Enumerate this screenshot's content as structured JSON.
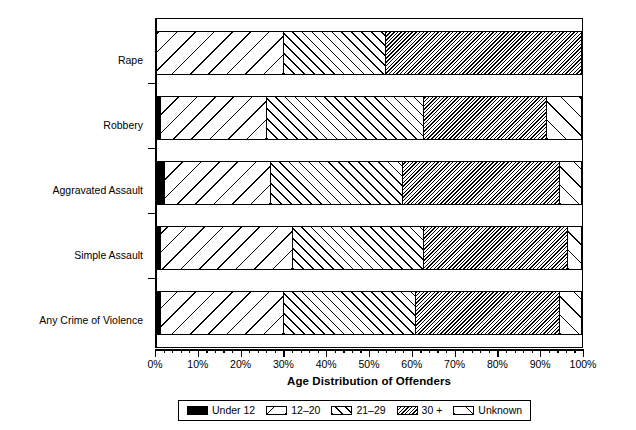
{
  "chart_data": {
    "type": "bar",
    "orientation": "horizontal",
    "stacked": true,
    "title": "",
    "xlabel": "Age Distribution of Offenders",
    "ylabel": "",
    "xlim": [
      0,
      100
    ],
    "grid": false,
    "legend_position": "bottom",
    "x_tick_labels": [
      "0%",
      "10%",
      "20%",
      "30%",
      "40%",
      "50%",
      "60%",
      "70%",
      "80%",
      "90%",
      "100%"
    ],
    "x_tick_values": [
      0,
      10,
      20,
      30,
      40,
      50,
      60,
      70,
      80,
      90,
      100
    ],
    "minor_ticks_per_interval": 5,
    "categories": [
      "Rape",
      "Robbery",
      "Aggravated Assault",
      "Simple Assault",
      "Any Crime of Violence"
    ],
    "series": [
      {
        "name": "Under 12",
        "values": [
          0,
          1,
          2,
          1,
          1
        ]
      },
      {
        "name": "12–20",
        "values": [
          30,
          25,
          25,
          31,
          29
        ]
      },
      {
        "name": "21–29",
        "values": [
          24,
          37,
          31,
          31,
          31
        ]
      },
      {
        "name": "30 +",
        "values": [
          46,
          29,
          37,
          34,
          34
        ]
      },
      {
        "name": "Unknown",
        "values": [
          0,
          8,
          5,
          3,
          5
        ]
      }
    ],
    "cumulative_boundaries": {
      "Rape": [
        0,
        30,
        54,
        100,
        100
      ],
      "Robbery": [
        1,
        26,
        63,
        92,
        100
      ],
      "Aggravated Assault": [
        2,
        27,
        58,
        95,
        100
      ],
      "Simple Assault": [
        1,
        32,
        63,
        97,
        100
      ],
      "Any Crime of Violence": [
        1,
        30,
        62,
        96,
        100
      ]
    }
  },
  "legend": {
    "items": [
      {
        "label": "Under 12",
        "pattern": "solid-black"
      },
      {
        "label": "12–20",
        "pattern": "wide-backslash-hatch"
      },
      {
        "label": "21–29",
        "pattern": "forward-slash-hatch"
      },
      {
        "label": "30 +",
        "pattern": "dense-backslash-hatch"
      },
      {
        "label": "Unknown",
        "pattern": "wide-forward-slash-hatch"
      }
    ]
  },
  "colors": {
    "ink": "#000000",
    "paper": "#ffffff"
  }
}
